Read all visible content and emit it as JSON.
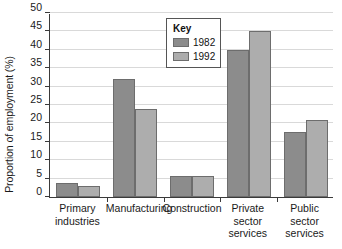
{
  "chart_data": {
    "type": "bar",
    "title": "",
    "xlabel": "",
    "ylabel": "Proportion of employment (%)",
    "ylim": [
      0,
      50
    ],
    "ytick_step": 5,
    "yticks": [
      "0",
      "5",
      "10",
      "15",
      "20",
      "25",
      "30",
      "35",
      "40",
      "45",
      "50"
    ],
    "grid": true,
    "legend_position": "inside-top-center",
    "categories": [
      "Primary\nindustries",
      "Manufacturing",
      "Construction",
      "Private\nsector\nservices",
      "Public\nsector\nservices"
    ],
    "series": [
      {
        "name": "1982",
        "color": "#8c8c8c",
        "values": [
          3.7,
          32,
          5.8,
          40,
          17.8
        ]
      },
      {
        "name": "1992",
        "color": "#adadad",
        "values": [
          3.0,
          24,
          5.8,
          45,
          21
        ]
      }
    ]
  },
  "legend": {
    "title": "Key",
    "entries": [
      {
        "label": "1982",
        "color": "#8c8c8c"
      },
      {
        "label": "1992",
        "color": "#adadad"
      }
    ]
  },
  "colors": {
    "series_1982": "#8c8c8c",
    "series_1992": "#adadad",
    "bar_outline": "#6d6d6d",
    "axis": "#3a3a3a",
    "gridline": "#d9d9d9",
    "background": "#ffffff",
    "text": "#1a1a1a"
  }
}
